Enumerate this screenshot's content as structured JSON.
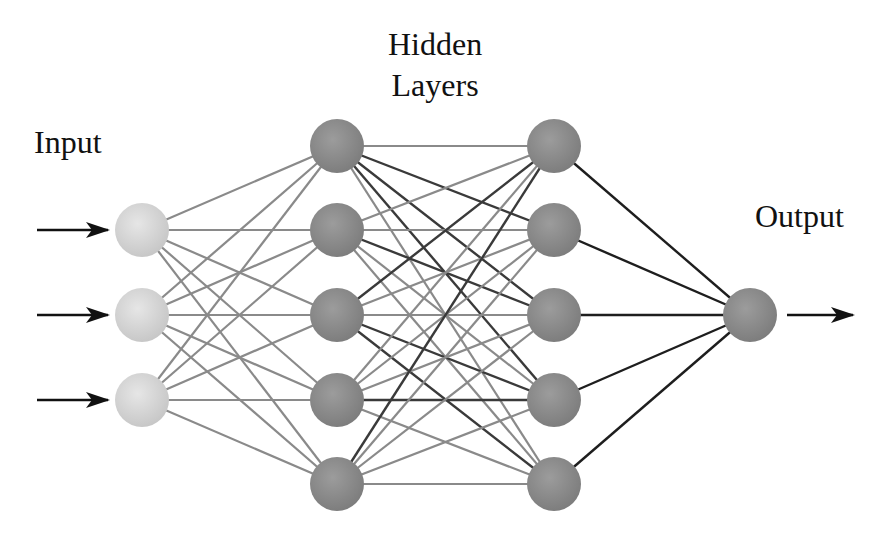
{
  "labels": {
    "input": "Input",
    "hidden_line1": "Hidden",
    "hidden_line2": "Layers",
    "output": "Output"
  },
  "colors": {
    "input_node": "#d6d6d6",
    "hidden_node": "#8c8c8c",
    "output_node": "#8e8e8e",
    "edge_light": "#8a8a8a",
    "edge_dark": "#3a3a3a",
    "edge_output": "#1e1e1e",
    "arrow": "#111111"
  },
  "network": {
    "node_radius": 27,
    "layers": [
      {
        "name": "input",
        "x": 142,
        "ys": [
          230,
          315,
          400
        ]
      },
      {
        "name": "hidden1",
        "x": 337,
        "ys": [
          146,
          230,
          315,
          400,
          484
        ]
      },
      {
        "name": "hidden2",
        "x": 554,
        "ys": [
          146,
          230,
          315,
          400,
          484
        ]
      },
      {
        "name": "output",
        "x": 750,
        "ys": [
          315
        ]
      }
    ],
    "dark_edges_hidden": [
      [
        0,
        1
      ],
      [
        0,
        2
      ],
      [
        0,
        3
      ],
      [
        2,
        0
      ],
      [
        1,
        2
      ],
      [
        2,
        3
      ],
      [
        3,
        3
      ],
      [
        2,
        4
      ],
      [
        4,
        0
      ]
    ],
    "input_arrows": [
      {
        "y": 230
      },
      {
        "y": 315
      },
      {
        "y": 400
      }
    ],
    "output_arrow": {
      "y": 315,
      "x1": 787,
      "x2": 853
    }
  }
}
